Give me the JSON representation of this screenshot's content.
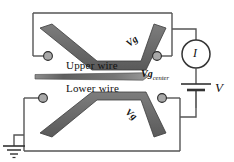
{
  "figure": {
    "type": "circuit-schematic",
    "background_color": "#ffffff",
    "wire_color": "#4a4a4a",
    "gate_fill_color": "#6e6e6e",
    "gate_stroke_color": "#3a3a3a",
    "pad_fill_color": "#a8a8a8",
    "pad_stroke_color": "#2b2b2b",
    "line_color": "#555555",
    "text_color": "#111111"
  },
  "labels": {
    "upper_wire": "Upper wire",
    "lower_wire": "Lower wire",
    "gate_upper": "Vg",
    "gate_lower": "Vg",
    "gate_center_main": "Vg",
    "gate_center_sub": "center",
    "current_meter": "I",
    "voltage_source": "V"
  },
  "components": {
    "ammeter": {
      "name": "current-meter",
      "symbol": "I"
    },
    "battery": {
      "name": "voltage-source",
      "symbol": "V"
    },
    "ground": {
      "name": "ground-symbol"
    },
    "contact_pads": [
      {
        "name": "pad-upper-left"
      },
      {
        "name": "pad-upper-right"
      },
      {
        "name": "pad-lower-left"
      },
      {
        "name": "pad-lower-right"
      }
    ],
    "gates": [
      {
        "name": "upper-split-gate",
        "shape": "v-trapezoid-down"
      },
      {
        "name": "center-gate-bar",
        "shape": "tapered-horizontal-bar"
      },
      {
        "name": "lower-split-gate",
        "shape": "v-trapezoid-up"
      }
    ]
  }
}
